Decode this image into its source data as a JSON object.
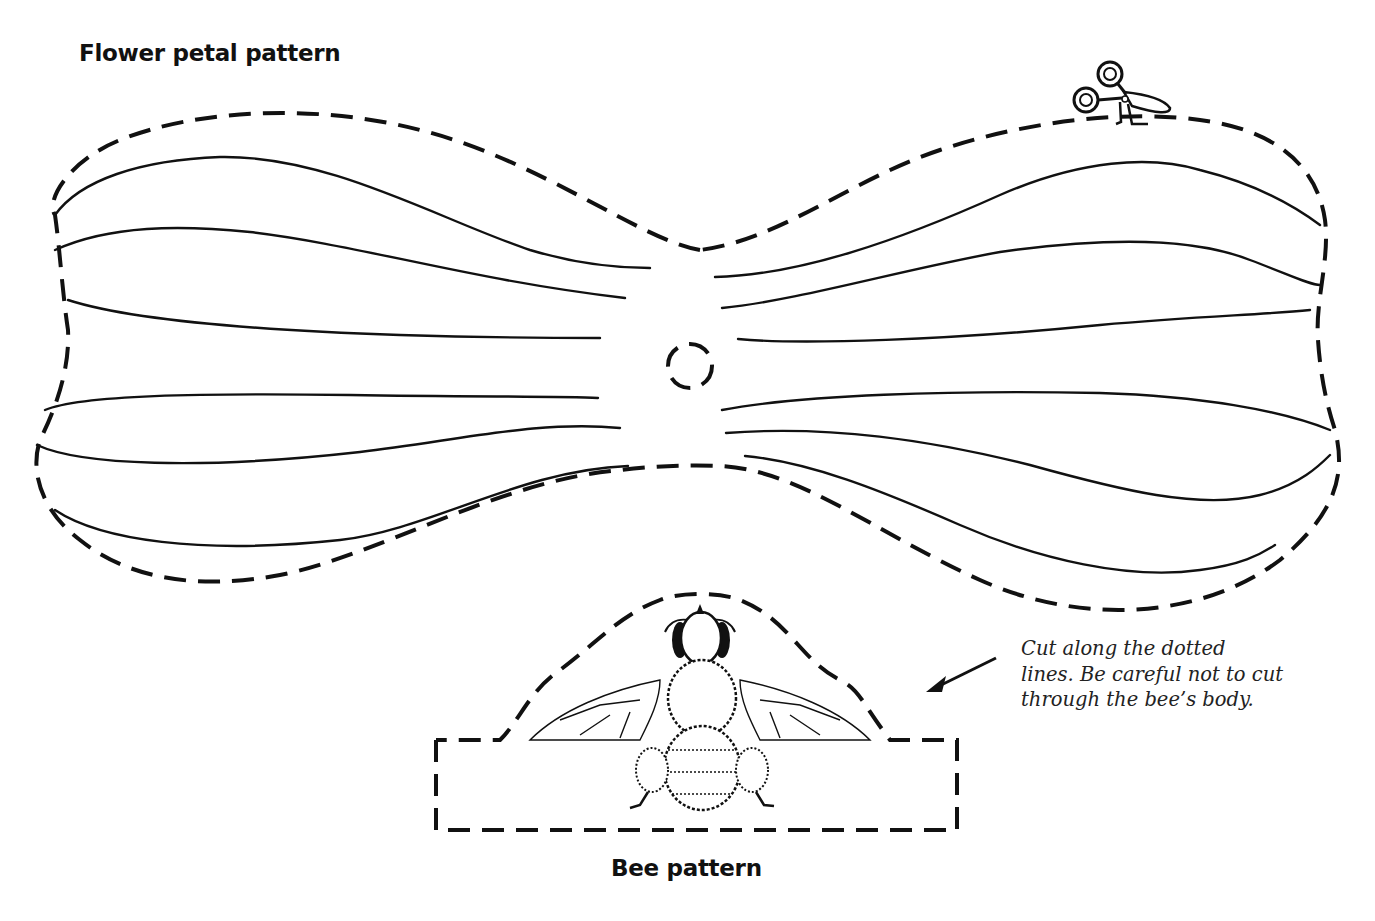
{
  "petal_pattern": {
    "title": "Flower petal pattern",
    "center_hole": "dashed-circle",
    "vein_count_per_side": 6
  },
  "bee_pattern": {
    "title": "Bee pattern"
  },
  "instructions": {
    "lines": [
      "Cut along the dotted",
      "lines. Be careful not to cut",
      "through the bee’s body."
    ]
  },
  "icons": {
    "scissors": "scissors-icon",
    "arrow": "arrow-pointing-to-bee"
  },
  "colors": {
    "ink": "#111111",
    "paper": "#ffffff"
  }
}
